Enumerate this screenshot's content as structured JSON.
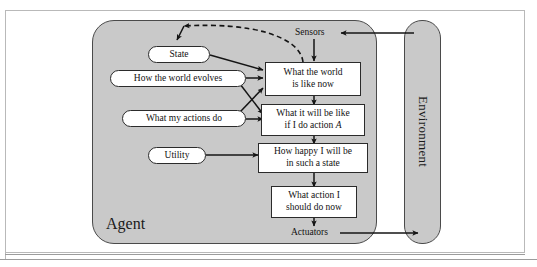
{
  "figure": {
    "agent_label": "Agent",
    "environment_label": "Environment",
    "colors": {
      "container_fill": "#c9c9c9",
      "node_fill": "#ffffff",
      "stroke": "#2b2b2b",
      "page_background": "#ffffff"
    }
  },
  "knowledge_nodes": [
    {
      "id": "state",
      "label": "State"
    },
    {
      "id": "how-world-evolves",
      "label": "How the world evolves"
    },
    {
      "id": "what-my-actions-do",
      "label": "What my actions do"
    },
    {
      "id": "utility",
      "label": "Utility"
    }
  ],
  "process_nodes": [
    {
      "id": "world-now",
      "line1": "What the world",
      "line2": "is like now"
    },
    {
      "id": "what-it-will-be-like",
      "line1": "What it will be like",
      "line2_pre": "if I do action ",
      "line2_em": "A"
    },
    {
      "id": "how-happy",
      "line1": "How happy I will be",
      "line2": "in such a state"
    },
    {
      "id": "what-action",
      "line1": "What action I",
      "line2": "should do now"
    }
  ],
  "boundary_labels": [
    {
      "id": "sensors",
      "label": "Sensors"
    },
    {
      "id": "actuators",
      "label": "Actuators"
    }
  ],
  "edges": [
    {
      "from": "environment",
      "to": "sensors",
      "style": "solid"
    },
    {
      "from": "sensors",
      "to": "world-now",
      "style": "solid"
    },
    {
      "from": "world-now",
      "to": "state",
      "style": "dashed"
    },
    {
      "from": "state",
      "to": "world-now",
      "style": "solid"
    },
    {
      "from": "how-world-evolves",
      "to": "world-now",
      "style": "solid"
    },
    {
      "from": "how-world-evolves",
      "to": "what-it-will-be-like",
      "style": "solid"
    },
    {
      "from": "what-my-actions-do",
      "to": "world-now",
      "style": "solid"
    },
    {
      "from": "what-my-actions-do",
      "to": "what-it-will-be-like",
      "style": "solid"
    },
    {
      "from": "world-now",
      "to": "what-it-will-be-like",
      "style": "solid"
    },
    {
      "from": "utility",
      "to": "how-happy",
      "style": "solid"
    },
    {
      "from": "what-it-will-be-like",
      "to": "how-happy",
      "style": "solid"
    },
    {
      "from": "how-happy",
      "to": "what-action",
      "style": "solid"
    },
    {
      "from": "what-action",
      "to": "actuators",
      "style": "solid"
    },
    {
      "from": "actuators",
      "to": "environment",
      "style": "solid"
    }
  ]
}
